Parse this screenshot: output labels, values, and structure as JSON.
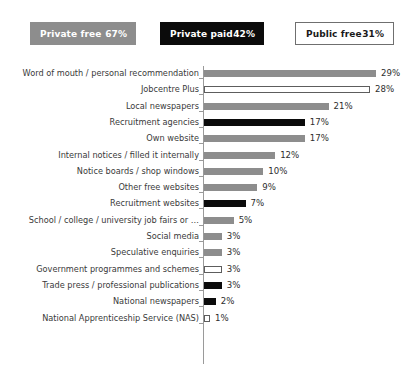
{
  "legend": {
    "items": [
      {
        "key": "private-free",
        "label": "Private free",
        "value": "67%",
        "style": "gray"
      },
      {
        "key": "private-paid",
        "label": "Private paid",
        "value": "42%",
        "style": "black"
      },
      {
        "key": "public-free",
        "label": "Public free",
        "value": "31%",
        "style": "white"
      }
    ]
  },
  "chart_data": {
    "type": "bar",
    "orientation": "horizontal",
    "title": "",
    "subtitle": "",
    "xlabel": "",
    "ylabel": "",
    "xlim": [
      0,
      30
    ],
    "grid": false,
    "legend_position": "top",
    "value_suffix": "%",
    "colors": {
      "gray": "#8d8d8d",
      "black": "#0b0b0b",
      "white": "#ffffff",
      "white_border": "#5d5d5d",
      "axis": "#9a9a9a"
    },
    "series_key": "legend",
    "categories": [
      "Word of mouth / personal recommendation",
      "Jobcentre Plus",
      "Local newspapers",
      "Recruitment agencies",
      "Own website",
      "Internal notices / filled it internally",
      "Notice boards / shop windows",
      "Other free websites",
      "Recruitment websites",
      "School / college / university job fairs or …",
      "Social media",
      "Speculative enquiries",
      "Government programmes and schemes",
      "Trade press / professional publications",
      "National newspapers",
      "National Apprenticeship Service (NAS)"
    ],
    "values": [
      29,
      28,
      21,
      17,
      17,
      12,
      10,
      9,
      7,
      5,
      3,
      3,
      3,
      3,
      2,
      1
    ],
    "value_labels": [
      "29%",
      "28%",
      "21%",
      "17%",
      "17%",
      "12%",
      "10%",
      "9%",
      "7%",
      "5%",
      "3%",
      "3%",
      "3%",
      "3%",
      "2%",
      "1%"
    ],
    "bar_styles": [
      "gray",
      "white",
      "gray",
      "black",
      "gray",
      "gray",
      "gray",
      "gray",
      "black",
      "gray",
      "gray",
      "gray",
      "white",
      "black",
      "black",
      "white"
    ]
  }
}
